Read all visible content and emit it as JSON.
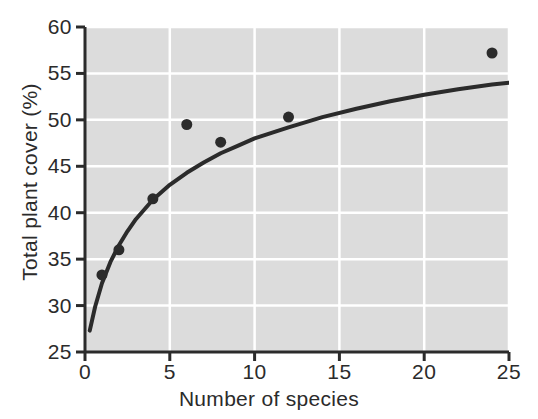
{
  "chart_data": {
    "type": "scatter",
    "title": "",
    "xlabel": "Number of species",
    "ylabel": "Total plant cover (%)",
    "xlim": [
      0,
      25
    ],
    "ylim": [
      25,
      60
    ],
    "xticks": [
      0,
      5,
      10,
      15,
      20,
      25
    ],
    "yticks": [
      25,
      30,
      35,
      40,
      45,
      50,
      55,
      60
    ],
    "xtick_labels": [
      "0",
      "5",
      "10",
      "15",
      "20",
      "25"
    ],
    "ytick_labels": [
      "25",
      "30",
      "35",
      "40",
      "45",
      "50",
      "55",
      "60"
    ],
    "grid": true,
    "grid_color": "#ffffff",
    "plot_background": "#dcdcdc",
    "legend": null,
    "marker_color": "#2b2b2b",
    "marker_shape": "filled-circle",
    "marker_size_px": 11,
    "x": [
      1,
      2,
      4,
      6,
      8,
      12,
      24
    ],
    "y": [
      33.3,
      36.0,
      41.5,
      49.5,
      47.6,
      50.3,
      57.2
    ],
    "points": [
      {
        "x": 1,
        "y": 33.3
      },
      {
        "x": 2,
        "y": 36.0
      },
      {
        "x": 4,
        "y": 41.5
      },
      {
        "x": 6,
        "y": 49.5
      },
      {
        "x": 8,
        "y": 47.6
      },
      {
        "x": 12,
        "y": 50.3
      },
      {
        "x": 24,
        "y": 57.2
      }
    ],
    "fit_curve": {
      "name": "saturating fit",
      "color": "#2b2b2b",
      "width_px": 4,
      "x_start": 0.28,
      "x_end": 25.0,
      "samples_x": [
        0.28,
        0.6,
        1.0,
        1.5,
        2.0,
        2.5,
        3.0,
        4.0,
        5.0,
        6.0,
        7.0,
        8.0,
        9.0,
        10.0,
        11.0,
        12.0,
        14.0,
        16.0,
        18.0,
        20.0,
        22.0,
        24.0,
        25.0
      ],
      "samples_y": [
        27.3,
        29.9,
        32.4,
        34.7,
        36.5,
        38.0,
        39.3,
        41.4,
        43.0,
        44.3,
        45.4,
        46.4,
        47.2,
        48.0,
        48.6,
        49.2,
        50.3,
        51.2,
        52.0,
        52.7,
        53.3,
        53.8,
        54.0
      ]
    }
  },
  "axes": {
    "x_axis_name": "number-of-species-axis",
    "y_axis_name": "total-plant-cover-axis"
  }
}
